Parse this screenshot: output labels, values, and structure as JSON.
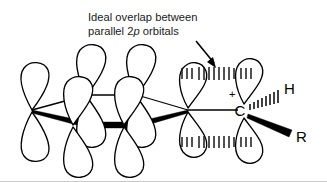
{
  "figure": {
    "title": "Ideal overlap between parallel 2p orbitals",
    "caption": {
      "line1": "Ideal overlap between",
      "line2_pre": "parallel 2",
      "line2_italic": "p",
      "line2_post": " orbitals"
    },
    "labels": {
      "carbon": "C",
      "hydrogen": "H",
      "substituent": "R",
      "charge": "+"
    },
    "icons": {
      "annotation_arrow": "arrow-down-right-icon",
      "solid_wedge": "solid-wedge-icon",
      "hashed_wedge": "hashed-wedge-icon",
      "p_orbital": "p-orbital-icon",
      "overlap_dashes": "orbital-overlap-dashes-icon"
    },
    "colors": {
      "stroke": "#000000",
      "fill": "#ffffff",
      "text": "#1a1a1a",
      "border": "#c9c9c9"
    },
    "counts": {
      "ring_p_orbitals": 4,
      "cation_p_orbitals": 2,
      "overlap_bands": 2
    }
  }
}
